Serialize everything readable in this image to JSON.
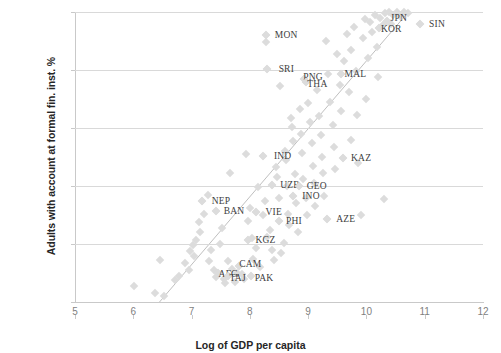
{
  "chart_data": {
    "type": "scatter",
    "title": "",
    "xlabel": "Log of GDP per capita",
    "ylabel": "Adults with account at formal fin. inst. %",
    "xlim": [
      5,
      12
    ],
    "ylim": [
      0,
      100
    ],
    "xticks": [
      5,
      6,
      7,
      8,
      9,
      10,
      11,
      12
    ],
    "yticks": [
      0,
      20,
      40,
      60,
      80,
      100
    ],
    "grid": "horizontal",
    "legend": "none",
    "marker": "diamond",
    "marker_color": "#dcdcdc",
    "trendline": {
      "type": "linear",
      "color": "#bfbfbf",
      "x_start": 6.45,
      "y_start": 0,
      "x_end": 10.72,
      "y_end": 100
    },
    "labeled_points": [
      {
        "label": "MON",
        "x": 8.28,
        "y": 92.0,
        "label_dx": 20,
        "label_dy": 0
      },
      {
        "label": "SRI",
        "x": 8.3,
        "y": 80.5,
        "label_dx": 19,
        "label_dy": 0
      },
      {
        "label": "PNG",
        "x": 8.93,
        "y": 77.0,
        "label_dx": 9,
        "label_dy": -2
      },
      {
        "label": "THA",
        "x": 8.97,
        "y": 75.8,
        "label_dx": 11,
        "label_dy": 2
      },
      {
        "label": "MAL",
        "x": 9.57,
        "y": 78.5,
        "label_dx": 14,
        "label_dy": 0
      },
      {
        "label": "KOR",
        "x": 10.22,
        "y": 94.5,
        "label_dx": 12,
        "label_dy": 1
      },
      {
        "label": "JPN",
        "x": 10.35,
        "y": 97.0,
        "label_dx": 12,
        "label_dy": -3
      },
      {
        "label": "SIN",
        "x": 10.92,
        "y": 96.0,
        "label_dx": 17,
        "label_dy": 0
      },
      {
        "label": "IND",
        "x": 8.22,
        "y": 50.5,
        "label_dx": 20,
        "label_dy": 0
      },
      {
        "label": "KAZ",
        "x": 9.6,
        "y": 49.5,
        "label_dx": 18,
        "label_dy": 0
      },
      {
        "label": "UZB",
        "x": 8.38,
        "y": 40.5,
        "label_dx": 18,
        "label_dy": 0
      },
      {
        "label": "GEO",
        "x": 8.84,
        "y": 40.0,
        "label_dx": 18,
        "label_dy": 0
      },
      {
        "label": "INO",
        "x": 8.74,
        "y": 36.5,
        "label_dx": 18,
        "label_dy": 0
      },
      {
        "label": "NEP",
        "x": 7.18,
        "y": 35.0,
        "label_dx": 19,
        "label_dy": 0
      },
      {
        "label": "BAN",
        "x": 7.42,
        "y": 31.5,
        "label_dx": 18,
        "label_dy": 0
      },
      {
        "label": "VIE",
        "x": 8.1,
        "y": 31.0,
        "label_dx": 18,
        "label_dy": 0
      },
      {
        "label": "PHI",
        "x": 8.5,
        "y": 28.0,
        "label_dx": 15,
        "label_dy": 0
      },
      {
        "label": "AZE",
        "x": 9.32,
        "y": 28.5,
        "label_dx": 19,
        "label_dy": 0
      },
      {
        "label": "KGZ",
        "x": 7.96,
        "y": 21.5,
        "label_dx": 18,
        "label_dy": 0
      },
      {
        "label": "AFG",
        "x": 7.46,
        "y": 10.0,
        "label_dx": 10,
        "label_dy": 1
      },
      {
        "label": "TAJ",
        "x": 7.62,
        "y": 9.0,
        "label_dx": 10,
        "label_dy": 2
      },
      {
        "label": "CAM",
        "x": 7.82,
        "y": 12.5,
        "label_dx": 11,
        "label_dy": -2
      },
      {
        "label": "PAK",
        "x": 8.02,
        "y": 9.0,
        "label_dx": 13,
        "label_dy": 2
      }
    ],
    "points": [
      {
        "x": 6.02,
        "y": 5.5
      },
      {
        "x": 6.38,
        "y": 3.0
      },
      {
        "x": 6.52,
        "y": 2.0
      },
      {
        "x": 6.45,
        "y": 14.5
      },
      {
        "x": 6.72,
        "y": 7.5
      },
      {
        "x": 6.78,
        "y": 9.0
      },
      {
        "x": 6.88,
        "y": 13.5
      },
      {
        "x": 6.95,
        "y": 11.0
      },
      {
        "x": 6.98,
        "y": 17.5
      },
      {
        "x": 7.02,
        "y": 19.5
      },
      {
        "x": 7.05,
        "y": 16.0
      },
      {
        "x": 7.08,
        "y": 21.5
      },
      {
        "x": 7.12,
        "y": 27.5
      },
      {
        "x": 7.14,
        "y": 24.0
      },
      {
        "x": 7.22,
        "y": 30.5
      },
      {
        "x": 7.28,
        "y": 37.0
      },
      {
        "x": 7.3,
        "y": 14.0
      },
      {
        "x": 7.34,
        "y": 18.0
      },
      {
        "x": 7.38,
        "y": 11.0
      },
      {
        "x": 7.42,
        "y": 8.5
      },
      {
        "x": 7.48,
        "y": 20.0
      },
      {
        "x": 7.52,
        "y": 25.5
      },
      {
        "x": 7.55,
        "y": 8.0
      },
      {
        "x": 7.58,
        "y": 6.5
      },
      {
        "x": 7.62,
        "y": 14.0
      },
      {
        "x": 7.66,
        "y": 44.5
      },
      {
        "x": 7.7,
        "y": 11.5
      },
      {
        "x": 7.74,
        "y": 7.0
      },
      {
        "x": 7.78,
        "y": 10.0
      },
      {
        "x": 7.86,
        "y": 9.5
      },
      {
        "x": 7.9,
        "y": 8.0
      },
      {
        "x": 7.94,
        "y": 51.0
      },
      {
        "x": 7.96,
        "y": 28.0
      },
      {
        "x": 8.0,
        "y": 32.5
      },
      {
        "x": 8.04,
        "y": 22.0
      },
      {
        "x": 8.06,
        "y": 15.0
      },
      {
        "x": 8.1,
        "y": 18.5
      },
      {
        "x": 8.14,
        "y": 39.5
      },
      {
        "x": 8.18,
        "y": 12.0
      },
      {
        "x": 8.22,
        "y": 30.0
      },
      {
        "x": 8.26,
        "y": 35.0
      },
      {
        "x": 8.28,
        "y": 89.5
      },
      {
        "x": 8.3,
        "y": 22.5
      },
      {
        "x": 8.34,
        "y": 25.0
      },
      {
        "x": 8.38,
        "y": 18.0
      },
      {
        "x": 8.42,
        "y": 14.5
      },
      {
        "x": 8.44,
        "y": 46.5
      },
      {
        "x": 8.46,
        "y": 43.0
      },
      {
        "x": 8.5,
        "y": 36.0
      },
      {
        "x": 8.52,
        "y": 74.5
      },
      {
        "x": 8.54,
        "y": 17.0
      },
      {
        "x": 8.58,
        "y": 20.5
      },
      {
        "x": 8.6,
        "y": 52.0
      },
      {
        "x": 8.62,
        "y": 49.0
      },
      {
        "x": 8.64,
        "y": 40.0
      },
      {
        "x": 8.66,
        "y": 30.5
      },
      {
        "x": 8.68,
        "y": 26.5
      },
      {
        "x": 8.7,
        "y": 63.5
      },
      {
        "x": 8.72,
        "y": 60.5
      },
      {
        "x": 8.74,
        "y": 55.5
      },
      {
        "x": 8.78,
        "y": 44.0
      },
      {
        "x": 8.8,
        "y": 34.0
      },
      {
        "x": 8.82,
        "y": 24.0
      },
      {
        "x": 8.86,
        "y": 66.5
      },
      {
        "x": 8.88,
        "y": 58.0
      },
      {
        "x": 8.9,
        "y": 51.5
      },
      {
        "x": 8.92,
        "y": 42.5
      },
      {
        "x": 8.96,
        "y": 36.0
      },
      {
        "x": 8.98,
        "y": 30.0
      },
      {
        "x": 9.0,
        "y": 68.5
      },
      {
        "x": 9.04,
        "y": 62.0
      },
      {
        "x": 9.06,
        "y": 55.0
      },
      {
        "x": 9.08,
        "y": 47.0
      },
      {
        "x": 9.1,
        "y": 41.0
      },
      {
        "x": 9.12,
        "y": 33.0
      },
      {
        "x": 9.16,
        "y": 73.0
      },
      {
        "x": 9.18,
        "y": 64.0
      },
      {
        "x": 9.22,
        "y": 57.5
      },
      {
        "x": 9.24,
        "y": 50.0
      },
      {
        "x": 9.26,
        "y": 44.5
      },
      {
        "x": 9.28,
        "y": 36.5
      },
      {
        "x": 9.3,
        "y": 90.0
      },
      {
        "x": 9.34,
        "y": 78.5
      },
      {
        "x": 9.38,
        "y": 69.0
      },
      {
        "x": 9.42,
        "y": 61.0
      },
      {
        "x": 9.44,
        "y": 53.5
      },
      {
        "x": 9.46,
        "y": 46.0
      },
      {
        "x": 9.5,
        "y": 85.5
      },
      {
        "x": 9.54,
        "y": 75.0
      },
      {
        "x": 9.56,
        "y": 66.0
      },
      {
        "x": 9.62,
        "y": 83.0
      },
      {
        "x": 9.66,
        "y": 92.5
      },
      {
        "x": 9.7,
        "y": 72.5
      },
      {
        "x": 9.74,
        "y": 87.0
      },
      {
        "x": 9.78,
        "y": 95.0
      },
      {
        "x": 9.82,
        "y": 79.5
      },
      {
        "x": 9.86,
        "y": 48.0
      },
      {
        "x": 9.9,
        "y": 30.0
      },
      {
        "x": 9.94,
        "y": 91.0
      },
      {
        "x": 9.98,
        "y": 97.5
      },
      {
        "x": 10.02,
        "y": 84.0
      },
      {
        "x": 10.06,
        "y": 96.5
      },
      {
        "x": 10.1,
        "y": 93.0
      },
      {
        "x": 10.14,
        "y": 99.0
      },
      {
        "x": 10.18,
        "y": 88.0
      },
      {
        "x": 10.24,
        "y": 98.0
      },
      {
        "x": 10.28,
        "y": 95.5
      },
      {
        "x": 10.32,
        "y": 99.5
      },
      {
        "x": 10.38,
        "y": 100.0
      },
      {
        "x": 10.42,
        "y": 96.0
      },
      {
        "x": 10.46,
        "y": 99.0
      },
      {
        "x": 10.52,
        "y": 100.0
      },
      {
        "x": 10.58,
        "y": 98.5
      },
      {
        "x": 10.64,
        "y": 100.0
      },
      {
        "x": 10.72,
        "y": 99.5
      },
      {
        "x": 10.2,
        "y": 77.5
      },
      {
        "x": 10.0,
        "y": 70.0
      },
      {
        "x": 9.84,
        "y": 64.5
      },
      {
        "x": 10.3,
        "y": 35.5
      },
      {
        "x": 9.74,
        "y": 56.0
      },
      {
        "x": 8.38,
        "y": 40.5
      },
      {
        "x": 8.84,
        "y": 40.0
      },
      {
        "x": 8.74,
        "y": 36.5
      },
      {
        "x": 7.18,
        "y": 35.0
      },
      {
        "x": 7.42,
        "y": 31.5
      },
      {
        "x": 8.1,
        "y": 31.0
      },
      {
        "x": 8.5,
        "y": 28.0
      },
      {
        "x": 9.32,
        "y": 28.5
      },
      {
        "x": 7.96,
        "y": 21.5
      },
      {
        "x": 7.46,
        "y": 10.0
      },
      {
        "x": 7.62,
        "y": 9.0
      },
      {
        "x": 7.82,
        "y": 12.5
      },
      {
        "x": 8.02,
        "y": 9.0
      },
      {
        "x": 8.22,
        "y": 50.5
      },
      {
        "x": 9.6,
        "y": 49.5
      },
      {
        "x": 8.28,
        "y": 92.0
      },
      {
        "x": 8.3,
        "y": 80.5
      },
      {
        "x": 8.93,
        "y": 77.0
      },
      {
        "x": 8.97,
        "y": 75.8
      },
      {
        "x": 9.57,
        "y": 78.5
      },
      {
        "x": 10.22,
        "y": 94.5
      },
      {
        "x": 10.35,
        "y": 97.0
      },
      {
        "x": 10.92,
        "y": 96.0
      }
    ]
  }
}
